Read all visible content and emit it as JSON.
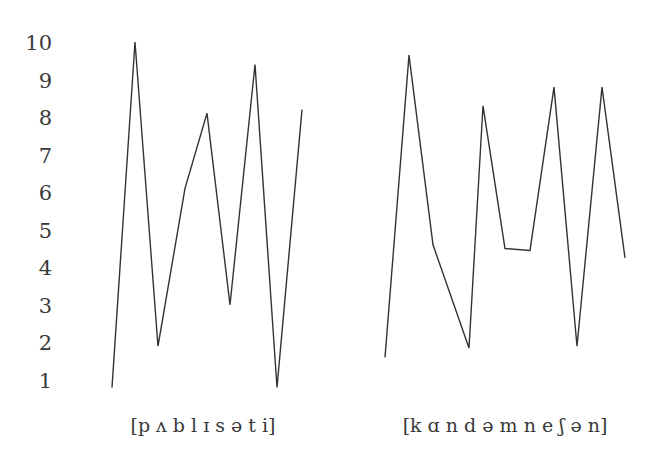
{
  "chart_data": {
    "type": "line",
    "title": "",
    "ylabel": "",
    "xlabel": "",
    "ylim": [
      1,
      10
    ],
    "yticks": [
      "1",
      "2",
      "3",
      "4",
      "5",
      "6",
      "7",
      "8",
      "9",
      "10"
    ],
    "grid": false,
    "legend": "none",
    "series": [
      {
        "name": "[p ʌ b l ɪ s ə t i]",
        "label": "[p ʌ b l ɪ s ə t i]",
        "x": [
          1,
          2,
          3,
          4,
          5,
          6,
          7,
          8,
          9
        ],
        "values": [
          0.8,
          10.0,
          1.9,
          6.1,
          8.1,
          3.0,
          9.4,
          0.8,
          8.2
        ]
      },
      {
        "name": "[k ɑ n d ə m n e ʃ ə n]",
        "label": "[k ɑ n d ə m n e ʃ ə n]",
        "x": [
          1,
          2,
          3,
          4,
          5,
          6,
          7,
          8,
          9,
          10,
          11
        ],
        "values": [
          1.6,
          9.65,
          4.6,
          1.85,
          8.3,
          4.5,
          4.45,
          8.8,
          1.9,
          8.8,
          4.25
        ]
      }
    ]
  },
  "layout": {
    "y_top_px": 42,
    "y_step_px": 37.55,
    "series_x_px": [
      [
        112,
        135,
        158,
        185,
        207,
        230,
        255,
        277,
        302
      ],
      [
        385,
        409,
        433,
        469,
        483,
        505,
        530,
        554,
        577,
        602,
        625
      ]
    ],
    "label_x_px": [
      203,
      505
    ],
    "label_y_px": 432,
    "tick_x_px": 52,
    "line_color": "#333333"
  }
}
